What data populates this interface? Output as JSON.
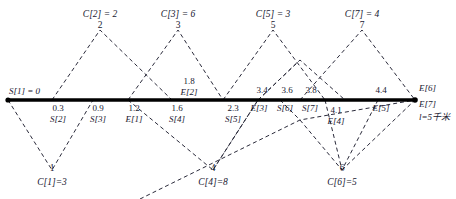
{
  "figure": {
    "axis": {
      "start_label": "S[1] = 0",
      "end_labels": [
        "E[6]",
        "E[7]",
        "l=5千米"
      ],
      "color": "#000000"
    },
    "peaks": [
      {
        "num": "2",
        "caption": "C[2] = 2"
      },
      {
        "num": "3",
        "caption": "C[3] = 6"
      },
      {
        "num": "5",
        "caption": "C[5] = 3"
      },
      {
        "num": "7",
        "caption": "C[7] = 4"
      }
    ],
    "valleys": [
      {
        "num": "1",
        "caption": "C[1]=3"
      },
      {
        "num": "4",
        "caption": "C[4]=8"
      },
      {
        "num": "6",
        "caption": "C[6]=5"
      }
    ],
    "axis_marks": [
      {
        "value": "0.3",
        "name": "S[2]"
      },
      {
        "value": "0.9",
        "name": "S[3]"
      },
      {
        "value": "1.2",
        "name": "E[1]"
      },
      {
        "value": "1.6",
        "name": "S[4]"
      },
      {
        "value": "1.8",
        "name": "E[2]"
      },
      {
        "value": "2.3",
        "name": "S[5]"
      },
      {
        "value": "3.4",
        "name": "E[3]"
      },
      {
        "value": "3.6",
        "name": "S[6]"
      },
      {
        "value": "3.8",
        "name": "S[7]"
      },
      {
        "value": "4.1",
        "name": "E[4]"
      },
      {
        "value": "4.4",
        "name": "E[5]"
      }
    ]
  }
}
